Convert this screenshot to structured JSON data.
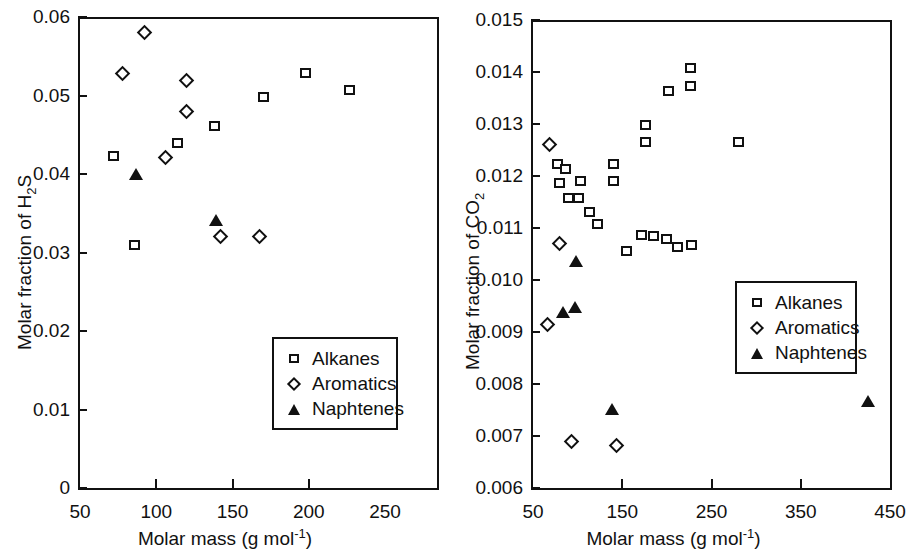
{
  "figure": {
    "panels": [
      {
        "id": "h2s",
        "chart_data": {
          "type": "scatter",
          "title": "",
          "xlabel": "Molar mass (g mol-1)",
          "xlabel_base": "Molar mass (g mol",
          "xlabel_sup": "-1",
          "xlabel_tail": ")",
          "ylabel": "Molar fraction of H2S",
          "ylabel_base": "Molar fraction of H",
          "ylabel_sub": "2",
          "ylabel_tail": "S",
          "xlim": [
            50,
            250
          ],
          "ylim": [
            0,
            0.06
          ],
          "xticks": [
            50,
            100,
            150,
            200,
            250
          ],
          "xticklabels": [
            "50",
            "100",
            "150",
            "200",
            "250"
          ],
          "yticks": [
            0,
            0.01,
            0.02,
            0.03,
            0.04,
            0.05,
            0.06
          ],
          "yticklabels": [
            "0",
            "0.01",
            "0.02",
            "0.03",
            "0.04",
            "0.05",
            "0.06"
          ],
          "grid": false,
          "legend_position": "lower right",
          "series": [
            {
              "name": "Alkanes",
              "marker": "open-square",
              "points": [
                {
                  "x": 72,
                  "y": 0.0423
                },
                {
                  "x": 86,
                  "y": 0.031
                },
                {
                  "x": 114,
                  "y": 0.044
                },
                {
                  "x": 138,
                  "y": 0.0461
                },
                {
                  "x": 170,
                  "y": 0.0498
                },
                {
                  "x": 198,
                  "y": 0.0529
                },
                {
                  "x": 227,
                  "y": 0.0507
                }
              ]
            },
            {
              "name": "Aromatics",
              "marker": "open-diamond",
              "points": [
                {
                  "x": 78,
                  "y": 0.0528
                },
                {
                  "x": 92,
                  "y": 0.058
                },
                {
                  "x": 106,
                  "y": 0.0421
                },
                {
                  "x": 120,
                  "y": 0.0519
                },
                {
                  "x": 120,
                  "y": 0.048
                },
                {
                  "x": 142,
                  "y": 0.0321
                },
                {
                  "x": 168,
                  "y": 0.0321
                }
              ]
            },
            {
              "name": "Naphtenes",
              "marker": "filled-triangle",
              "points": [
                {
                  "x": 87,
                  "y": 0.0399
                },
                {
                  "x": 139,
                  "y": 0.034
                }
              ]
            }
          ]
        }
      },
      {
        "id": "co2",
        "chart_data": {
          "type": "scatter",
          "title": "",
          "xlabel": "Molar mass (g mol-1)",
          "xlabel_base": "Molar mass (g mol",
          "xlabel_sup": "-1",
          "xlabel_tail": ")",
          "ylabel": "Molar fraction of CO2",
          "ylabel_base": "Molar fraction of CO",
          "ylabel_sub": "2",
          "ylabel_tail": "",
          "xlim": [
            50,
            450
          ],
          "ylim": [
            0.006,
            0.015
          ],
          "xticks": [
            50,
            150,
            250,
            350,
            450
          ],
          "xticklabels": [
            "50",
            "150",
            "250",
            "350",
            "450"
          ],
          "yticks": [
            0.006,
            0.007,
            0.008,
            0.009,
            0.01,
            0.011,
            0.012,
            0.013,
            0.014,
            0.015
          ],
          "yticklabels": [
            "0.006",
            "0.007",
            "0.008",
            "0.009",
            "0.010",
            "0.011",
            "0.012",
            "0.013",
            "0.014",
            "0.015"
          ],
          "grid": false,
          "legend_position": "center right",
          "series": [
            {
              "name": "Alkanes",
              "marker": "open-square",
              "points": [
                {
                  "x": 78,
                  "y": 0.01223
                },
                {
                  "x": 86,
                  "y": 0.01213
                },
                {
                  "x": 80,
                  "y": 0.01187
                },
                {
                  "x": 90,
                  "y": 0.01158
                },
                {
                  "x": 101,
                  "y": 0.01157
                },
                {
                  "x": 103,
                  "y": 0.01191
                },
                {
                  "x": 113,
                  "y": 0.01131
                },
                {
                  "x": 122,
                  "y": 0.01108
                },
                {
                  "x": 140,
                  "y": 0.01224
                },
                {
                  "x": 140,
                  "y": 0.0119
                },
                {
                  "x": 155,
                  "y": 0.01055
                },
                {
                  "x": 172,
                  "y": 0.01086
                },
                {
                  "x": 176,
                  "y": 0.01298
                },
                {
                  "x": 176,
                  "y": 0.01266
                },
                {
                  "x": 185,
                  "y": 0.01085
                },
                {
                  "x": 200,
                  "y": 0.01079
                },
                {
                  "x": 202,
                  "y": 0.01364
                },
                {
                  "x": 212,
                  "y": 0.01064
                },
                {
                  "x": 226,
                  "y": 0.01408
                },
                {
                  "x": 226,
                  "y": 0.01374
                },
                {
                  "x": 228,
                  "y": 0.01068
                },
                {
                  "x": 280,
                  "y": 0.01265
                }
              ]
            },
            {
              "name": "Aromatics",
              "marker": "open-diamond",
              "points": [
                {
                  "x": 68,
                  "y": 0.01261
                },
                {
                  "x": 66,
                  "y": 0.00914
                },
                {
                  "x": 80,
                  "y": 0.0107
                },
                {
                  "x": 93,
                  "y": 0.00689
                },
                {
                  "x": 143,
                  "y": 0.00681
                }
              ]
            },
            {
              "name": "Naphtenes",
              "marker": "filled-triangle",
              "points": [
                {
                  "x": 84,
                  "y": 0.00936
                },
                {
                  "x": 97,
                  "y": 0.00947
                },
                {
                  "x": 98,
                  "y": 0.01035
                },
                {
                  "x": 139,
                  "y": 0.0075
                },
                {
                  "x": 425,
                  "y": 0.00766
                }
              ]
            }
          ]
        }
      }
    ]
  }
}
